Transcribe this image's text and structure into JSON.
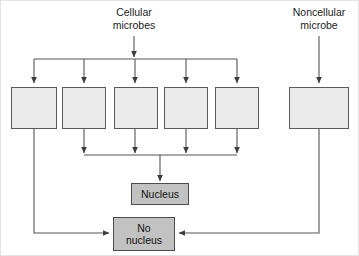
{
  "diagram": {
    "background_color": "#ffffff",
    "line_color": "#555555",
    "blank_box_fill": "#ebebeb",
    "shaded_box_fill": "#c2c2c2",
    "top_labels": [
      {
        "id": "cellular",
        "text": "Cellular\nmicrobes"
      },
      {
        "id": "noncellular",
        "text": "Noncellular\nmicrobe"
      }
    ],
    "blank_boxes": [
      {
        "id": "blank-1",
        "text": ""
      },
      {
        "id": "blank-2",
        "text": ""
      },
      {
        "id": "blank-3",
        "text": ""
      },
      {
        "id": "blank-4",
        "text": ""
      },
      {
        "id": "blank-5",
        "text": ""
      },
      {
        "id": "blank-noncellular",
        "text": ""
      }
    ],
    "outcome_boxes": [
      {
        "id": "nucleus",
        "text": "Nucleus"
      },
      {
        "id": "no-nucleus",
        "text": "No\nnucleus"
      }
    ]
  }
}
